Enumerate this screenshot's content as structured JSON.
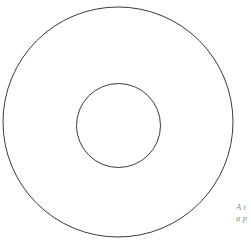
{
  "figure": {
    "background_color": "#ffffff",
    "width": 251,
    "height": 244,
    "stroke_color": "#3a3a3a",
    "stroke_width": 1
  },
  "shapes": {
    "outer_circle": {
      "label": "outer-circle",
      "cx": 118,
      "cy": 122,
      "r": 115,
      "stroke": "#3a3a3a",
      "fill": "none"
    },
    "inner_circle": {
      "label": "inner-circle",
      "cx": 118.5,
      "cy": 125.5,
      "r": 42,
      "stroke": "#3a3a3a",
      "fill": "none"
    }
  },
  "caption": {
    "color": "#8c8c8c",
    "line1": "A t",
    "line2": "a p"
  }
}
